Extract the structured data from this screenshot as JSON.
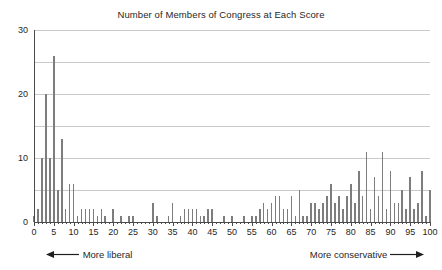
{
  "chart_data": {
    "type": "bar",
    "title": "Number of Members of Congress at Each Score",
    "xlabel": "",
    "ylabel": "",
    "xlim": [
      0,
      100
    ],
    "ylim": [
      0,
      30
    ],
    "grid": true,
    "legend": null,
    "bar_color": "#7d7d7d",
    "axis_color": "#4a4a4a",
    "grid_color": "#c9c9c9",
    "y_ticks": [
      0,
      10,
      20,
      30
    ],
    "y_gridlines": [
      5,
      10,
      15,
      20,
      25,
      30
    ],
    "x_ticks": [
      0,
      5,
      10,
      15,
      20,
      25,
      30,
      35,
      40,
      45,
      50,
      55,
      60,
      65,
      70,
      75,
      80,
      85,
      90,
      95,
      100
    ],
    "x": [
      0,
      1,
      2,
      3,
      4,
      5,
      6,
      7,
      8,
      9,
      10,
      11,
      12,
      13,
      14,
      15,
      16,
      17,
      18,
      19,
      20,
      21,
      22,
      23,
      24,
      25,
      26,
      27,
      28,
      29,
      30,
      31,
      32,
      33,
      34,
      35,
      36,
      37,
      38,
      39,
      40,
      41,
      42,
      43,
      44,
      45,
      46,
      47,
      48,
      49,
      50,
      51,
      52,
      53,
      54,
      55,
      56,
      57,
      58,
      59,
      60,
      61,
      62,
      63,
      64,
      65,
      66,
      67,
      68,
      69,
      70,
      71,
      72,
      73,
      74,
      75,
      76,
      77,
      78,
      79,
      80,
      81,
      82,
      83,
      84,
      85,
      86,
      87,
      88,
      89,
      90,
      91,
      92,
      93,
      94,
      95,
      96,
      97,
      98,
      99,
      100
    ],
    "values": [
      1,
      2,
      10,
      20,
      10,
      26,
      5,
      13,
      2,
      6,
      6,
      1,
      2,
      2,
      2,
      2,
      1,
      2,
      1,
      0,
      2,
      0,
      1,
      0,
      1,
      1,
      0,
      0,
      0,
      0,
      3,
      1,
      0,
      0,
      1,
      3,
      0,
      1,
      2,
      2,
      2,
      2,
      1,
      1,
      2,
      2,
      0,
      0,
      1,
      0,
      1,
      0,
      0,
      1,
      0,
      1,
      1,
      2,
      3,
      2,
      3,
      4,
      4,
      2,
      2,
      4,
      1,
      5,
      1,
      1,
      3,
      3,
      2,
      3,
      4,
      6,
      3,
      4,
      2,
      4,
      6,
      3,
      8,
      4,
      11,
      2,
      7,
      4,
      11,
      2,
      8,
      3,
      3,
      5,
      2,
      7,
      2,
      3,
      8,
      1,
      5
    ],
    "annotations": {
      "left_label": "More liberal",
      "right_label": "More conservative",
      "left_arrow": "arrow-left-icon",
      "right_arrow": "arrow-right-icon"
    }
  }
}
